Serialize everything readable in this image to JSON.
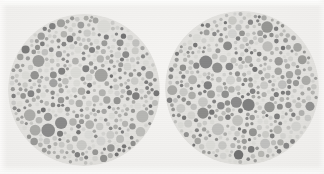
{
  "image": {
    "title": "Pseudoisochromatic colour-vision test plates",
    "description": "Two circular Ishihara-style colour vision test plates side by side, reproduced in greyscale on off-white paper",
    "plate_count": 2,
    "background_color": "#efeeec",
    "paper_highlight_color": "#fbfbfa"
  },
  "palette": {
    "plate_field_color": "#e2e1de",
    "dot_tones": [
      "#6f6f6f",
      "#7d7d7d",
      "#8a8a88",
      "#979795",
      "#a3a3a0",
      "#b0b0ad",
      "#bcbcb9",
      "#c7c7c4",
      "#d1d1ce",
      "#dadad6"
    ],
    "dark_dot_color": "#6f6f6f",
    "light_dot_color": "#dadad6"
  },
  "plates": [
    {
      "id": "plate-left",
      "label": "Left test plate",
      "center_x": 84,
      "center_y": 90,
      "radius": 76,
      "visible_figure": "",
      "seed": 17
    },
    {
      "id": "plate-right",
      "label": "Right test plate",
      "center_x": 242,
      "center_y": 88,
      "radius": 77,
      "visible_figure": "",
      "seed": 93
    }
  ],
  "canvas": {
    "width": 324,
    "height": 174
  }
}
